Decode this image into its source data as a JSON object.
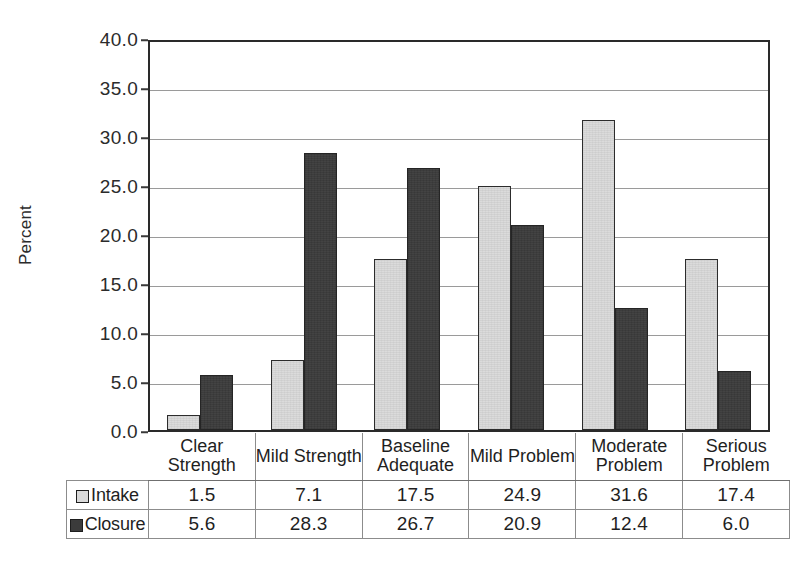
{
  "chart_data": {
    "type": "bar",
    "title": "",
    "subtitle": "",
    "xlabel": "",
    "ylabel": "Percent",
    "ylim": [
      0.0,
      40.0
    ],
    "ytick_step": 5.0,
    "ytick_labels": [
      "40.0",
      "35.0",
      "30.0",
      "25.0",
      "20.0",
      "15.0",
      "10.0",
      "5.0",
      "0.0"
    ],
    "ytick_values": [
      40.0,
      35.0,
      30.0,
      25.0,
      20.0,
      15.0,
      10.0,
      5.0,
      0.0
    ],
    "grid": true,
    "legend_position": "bottom-table",
    "categories": [
      "Clear Strength",
      "Mild Strength",
      "Baseline Adequate",
      "Mild Problem",
      "Moderate Problem",
      "Serious Problem"
    ],
    "category_lines": [
      [
        "Clear",
        "Strength"
      ],
      [
        "Mild Strength"
      ],
      [
        "Baseline",
        "Adequate"
      ],
      [
        "Mild Problem"
      ],
      [
        "Moderate",
        "Problem"
      ],
      [
        "Serious",
        "Problem"
      ]
    ],
    "series": [
      {
        "name": "Intake",
        "color": "#d9d9d9",
        "values": [
          1.5,
          7.1,
          17.5,
          24.9,
          31.6,
          17.4
        ],
        "labels": [
          "1.5",
          "7.1",
          "17.5",
          "24.9",
          "31.6",
          "17.4"
        ]
      },
      {
        "name": "Closure",
        "color": "#3b3b3b",
        "values": [
          5.6,
          28.3,
          26.7,
          20.9,
          12.4,
          6.0
        ],
        "labels": [
          "5.6",
          "28.3",
          "26.7",
          "20.9",
          "12.4",
          "6.0"
        ]
      }
    ]
  },
  "colors": {
    "intake": "#d9d9d9",
    "closure": "#3b3b3b",
    "axis": "#2a2a2a",
    "gridline": "#9a9a9a",
    "text": "#1f1f1f"
  },
  "axis": {
    "y_title": "Percent"
  },
  "legend": {
    "items": [
      {
        "label": "Intake",
        "swatch": "light-gray-square-icon"
      },
      {
        "label": "Closure",
        "swatch": "dark-gray-square-icon"
      }
    ]
  }
}
